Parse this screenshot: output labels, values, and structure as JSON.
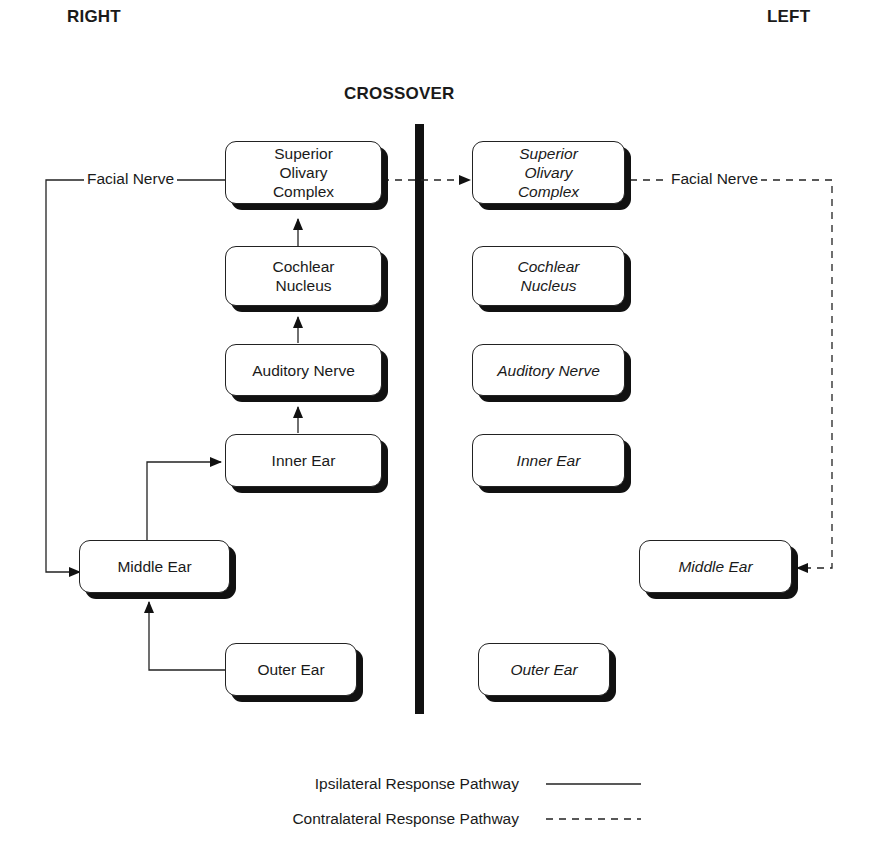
{
  "headings": {
    "right": "RIGHT",
    "left": "LEFT",
    "crossover": "CROSSOVER"
  },
  "right_side": {
    "superior_olivary_complex": "Superior Olivary Complex",
    "cochlear_nucleus": "Cochlear Nucleus",
    "auditory_nerve": "Auditory Nerve",
    "inner_ear": "Inner Ear",
    "middle_ear": "Middle Ear",
    "outer_ear": "Outer Ear",
    "facial_nerve": "Facial Nerve"
  },
  "left_side": {
    "superior_olivary_complex": "Superior Olivary Complex",
    "cochlear_nucleus": "Cochlear Nucleus",
    "auditory_nerve": "Auditory Nerve",
    "inner_ear": "Inner Ear",
    "middle_ear": "Middle Ear",
    "outer_ear": "Outer Ear",
    "facial_nerve": "Facial Nerve"
  },
  "legend": {
    "ipsilateral": "Ipsilateral Response Pathway",
    "contralateral": "Contralateral Response Pathway"
  },
  "colors": {
    "line": "#222222",
    "shadow": "#111111",
    "background": "#ffffff"
  }
}
